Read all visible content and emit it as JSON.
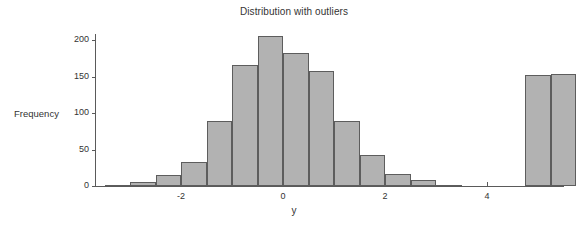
{
  "chart_data": {
    "type": "bar",
    "title": "Distribution with outliers",
    "xlabel": "y",
    "ylabel": "Frequency",
    "xlim": [
      -3.5,
      5.5
    ],
    "ylim": [
      0,
      208
    ],
    "grid": false,
    "legend": null,
    "bin_width": 0.5,
    "bar_color": "#b2b2b2",
    "bar_edge_color": "#5d5d5d",
    "xticks": [
      -2,
      0,
      2,
      4
    ],
    "xtick_labels": [
      "-2",
      "0",
      "2",
      "4"
    ],
    "yticks": [
      0,
      50,
      100,
      150,
      200
    ],
    "ytick_labels": [
      "0",
      "50",
      "100",
      "150",
      "200"
    ],
    "bin_left_edges": [
      -3.5,
      -3.0,
      -2.5,
      -2.0,
      -1.5,
      -1.0,
      -0.5,
      0.0,
      0.5,
      1.0,
      1.5,
      2.0,
      2.5,
      3.0,
      3.5,
      4.75,
      5.25
    ],
    "values": [
      2,
      5,
      15,
      33,
      89,
      166,
      205,
      182,
      157,
      89,
      43,
      16,
      8,
      2,
      0,
      152,
      153
    ],
    "categories": [
      "-3.5",
      "-3.0",
      "-2.5",
      "-2.0",
      "-1.5",
      "-1.0",
      "-0.5",
      "0.0",
      "0.5",
      "1.0",
      "1.5",
      "2.0",
      "2.5",
      "3.0",
      "3.5",
      "4.75",
      "5.25"
    ]
  }
}
